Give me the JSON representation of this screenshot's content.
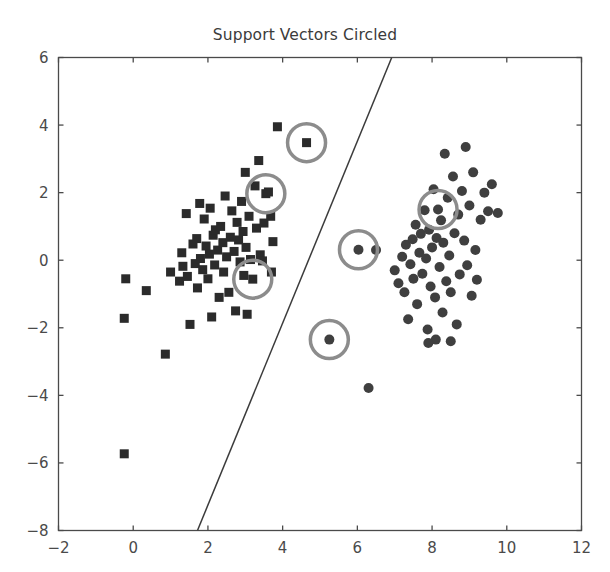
{
  "chart_data": {
    "type": "scatter",
    "title": "Support Vectors Circled",
    "xlabel": "",
    "ylabel": "",
    "xlim": [
      -2,
      12
    ],
    "ylim": [
      -8,
      6
    ],
    "xticks": [
      -2,
      0,
      2,
      4,
      6,
      8,
      10,
      12
    ],
    "yticks": [
      -8,
      -6,
      -4,
      -2,
      0,
      2,
      4,
      6
    ],
    "xticklabels": [
      "−2",
      "0",
      "2",
      "4",
      "6",
      "8",
      "10",
      "12"
    ],
    "yticklabels": [
      "−8",
      "−6",
      "−4",
      "−2",
      "0",
      "2",
      "4",
      "6"
    ],
    "grid": false,
    "legend": null,
    "series": [
      {
        "name": "class-0",
        "marker": "square",
        "color": "#2b2b2b",
        "size": 9,
        "points": [
          [
            -0.2,
            -0.55
          ],
          [
            -0.24,
            -1.72
          ],
          [
            -0.24,
            -5.73
          ],
          [
            0.35,
            -0.9
          ],
          [
            0.86,
            -2.78
          ],
          [
            1.0,
            -0.35
          ],
          [
            1.24,
            -0.62
          ],
          [
            1.3,
            0.22
          ],
          [
            1.33,
            -0.18
          ],
          [
            1.42,
            1.38
          ],
          [
            1.45,
            -0.48
          ],
          [
            1.52,
            -1.9
          ],
          [
            1.6,
            0.48
          ],
          [
            1.66,
            -0.1
          ],
          [
            1.7,
            0.64
          ],
          [
            1.72,
            -0.82
          ],
          [
            1.78,
            1.68
          ],
          [
            1.8,
            0.05
          ],
          [
            1.86,
            -0.28
          ],
          [
            1.9,
            1.22
          ],
          [
            1.95,
            0.42
          ],
          [
            2.0,
            -0.55
          ],
          [
            2.04,
            0.18
          ],
          [
            2.06,
            1.54
          ],
          [
            2.1,
            -1.68
          ],
          [
            2.14,
            0.74
          ],
          [
            2.18,
            -0.14
          ],
          [
            2.2,
            0.9
          ],
          [
            2.26,
            0.3
          ],
          [
            2.3,
            -1.1
          ],
          [
            2.34,
            1.0
          ],
          [
            2.4,
            0.52
          ],
          [
            2.42,
            -0.35
          ],
          [
            2.46,
            1.9
          ],
          [
            2.5,
            0.1
          ],
          [
            2.56,
            -0.95
          ],
          [
            2.6,
            0.68
          ],
          [
            2.64,
            1.46
          ],
          [
            2.7,
            0.26
          ],
          [
            2.74,
            -1.5
          ],
          [
            2.78,
            1.12
          ],
          [
            2.82,
            0.6
          ],
          [
            2.86,
            -0.05
          ],
          [
            2.9,
            1.74
          ],
          [
            2.94,
            0.85
          ],
          [
            2.96,
            -0.45
          ],
          [
            3.0,
            2.6
          ],
          [
            3.02,
            0.38
          ],
          [
            3.05,
            -1.6
          ],
          [
            3.1,
            1.3
          ],
          [
            3.14,
            0.02
          ],
          [
            3.2,
            -0.56
          ],
          [
            3.26,
            2.2
          ],
          [
            3.3,
            0.95
          ],
          [
            3.36,
            2.95
          ],
          [
            3.4,
            0.16
          ],
          [
            3.46,
            -0.02
          ],
          [
            3.5,
            1.1
          ],
          [
            3.55,
            1.97
          ],
          [
            3.62,
            2.02
          ],
          [
            3.68,
            1.3
          ],
          [
            3.7,
            -0.35
          ],
          [
            3.74,
            0.55
          ],
          [
            3.86,
            3.95
          ],
          [
            4.64,
            3.48
          ]
        ]
      },
      {
        "name": "class-1",
        "marker": "circle",
        "color": "#3f3f3f",
        "size": 10,
        "points": [
          [
            5.25,
            -2.35
          ],
          [
            6.03,
            0.31
          ],
          [
            6.3,
            -3.78
          ],
          [
            6.5,
            0.3
          ],
          [
            7.0,
            -0.3
          ],
          [
            7.1,
            -0.68
          ],
          [
            7.2,
            0.1
          ],
          [
            7.26,
            -0.95
          ],
          [
            7.3,
            0.46
          ],
          [
            7.36,
            -1.75
          ],
          [
            7.42,
            -0.12
          ],
          [
            7.48,
            0.62
          ],
          [
            7.5,
            -0.55
          ],
          [
            7.56,
            1.05
          ],
          [
            7.6,
            -1.3
          ],
          [
            7.66,
            0.22
          ],
          [
            7.7,
            0.78
          ],
          [
            7.74,
            -0.4
          ],
          [
            7.8,
            1.48
          ],
          [
            7.84,
            0.05
          ],
          [
            7.88,
            -2.05
          ],
          [
            7.92,
            0.9
          ],
          [
            7.96,
            -0.78
          ],
          [
            8.0,
            0.38
          ],
          [
            8.04,
            2.1
          ],
          [
            8.08,
            -1.1
          ],
          [
            8.12,
            0.66
          ],
          [
            8.16,
            1.5
          ],
          [
            8.2,
            -0.2
          ],
          [
            8.24,
            1.18
          ],
          [
            8.28,
            -1.55
          ],
          [
            8.3,
            0.52
          ],
          [
            8.34,
            3.15
          ],
          [
            8.38,
            -0.62
          ],
          [
            8.42,
            1.85
          ],
          [
            8.46,
            0.14
          ],
          [
            8.5,
            -0.95
          ],
          [
            8.56,
            2.48
          ],
          [
            8.6,
            0.8
          ],
          [
            8.66,
            -1.9
          ],
          [
            8.7,
            1.35
          ],
          [
            8.74,
            -0.42
          ],
          [
            8.8,
            2.05
          ],
          [
            8.86,
            0.58
          ],
          [
            8.9,
            3.35
          ],
          [
            8.94,
            -0.15
          ],
          [
            9.0,
            1.62
          ],
          [
            9.06,
            -1.05
          ],
          [
            9.1,
            2.6
          ],
          [
            9.16,
            0.3
          ],
          [
            9.2,
            -0.58
          ],
          [
            9.3,
            1.2
          ],
          [
            9.4,
            2.0
          ],
          [
            9.5,
            1.45
          ],
          [
            9.6,
            2.25
          ],
          [
            9.76,
            1.4
          ],
          [
            8.1,
            -2.35
          ],
          [
            8.5,
            -2.4
          ],
          [
            7.9,
            -2.45
          ]
        ]
      }
    ],
    "decision_boundary": {
      "name": "decision-boundary",
      "color": "#3b3b3b",
      "x1": 1.72,
      "y1": -8.0,
      "x2": 6.92,
      "y2": 6.0
    },
    "support_vectors": {
      "name": "support-vector-highlights",
      "ring_color": "#8c8c8c",
      "ring_radius_px": 19,
      "ring_width_px": 3.5,
      "points": [
        [
          4.64,
          3.48
        ],
        [
          3.55,
          1.97
        ],
        [
          3.2,
          -0.56
        ],
        [
          6.03,
          0.31
        ],
        [
          5.25,
          -2.35
        ],
        [
          8.16,
          1.5
        ]
      ]
    }
  },
  "axes": {
    "frame_color": "#4a4a4a",
    "tick_color": "#4a4a4a"
  }
}
